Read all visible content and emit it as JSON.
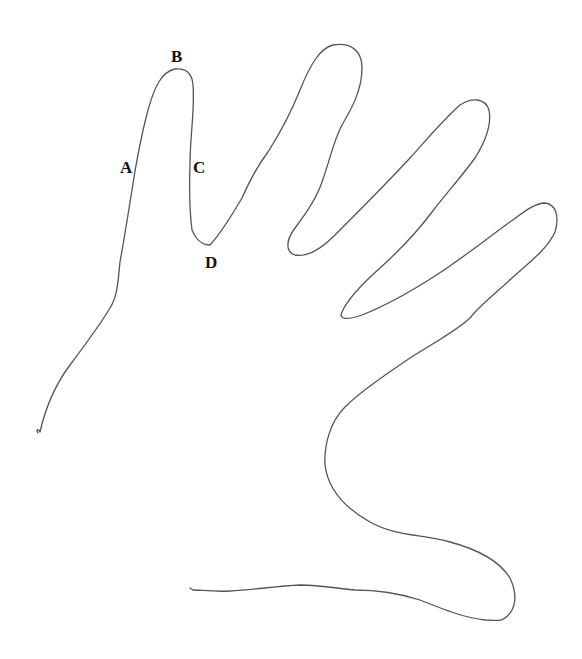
{
  "figure": {
    "stroke_color": "#555555",
    "background": "#ffffff"
  },
  "labels": [
    {
      "id": "A",
      "text": "A",
      "x": 120,
      "y": 159
    },
    {
      "id": "B",
      "text": "B",
      "x": 171,
      "y": 48
    },
    {
      "id": "C",
      "text": "C",
      "x": 193,
      "y": 159
    },
    {
      "id": "D",
      "text": "D",
      "x": 205,
      "y": 254
    }
  ]
}
